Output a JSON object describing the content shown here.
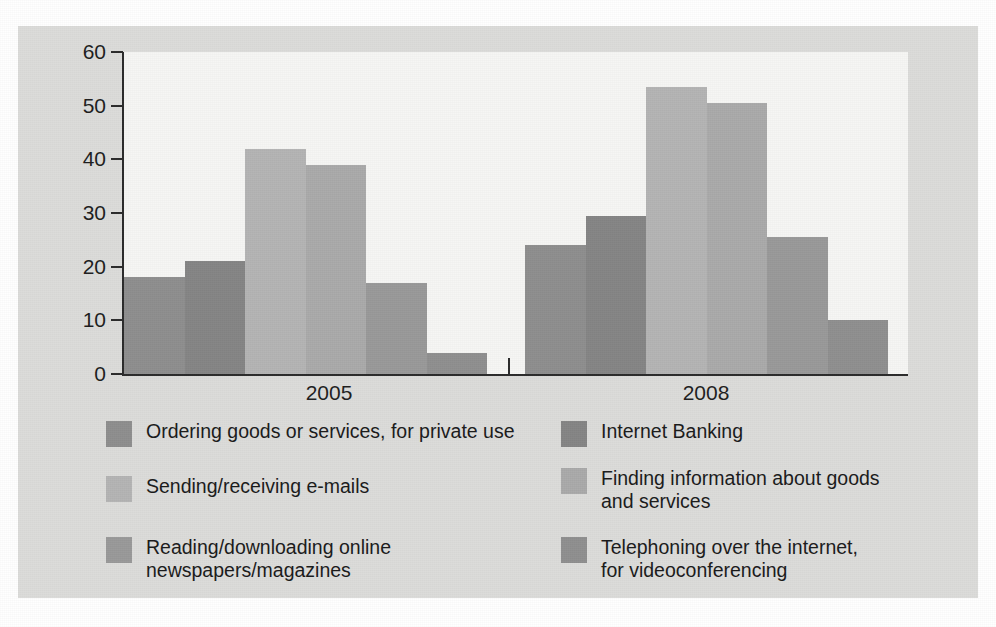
{
  "chart_data": {
    "type": "bar",
    "title": "",
    "subtitle": "",
    "xlabel": "",
    "ylabel": "",
    "categories": [
      "2005",
      "2008"
    ],
    "ylim": [
      0,
      60
    ],
    "yticks": [
      0,
      10,
      20,
      30,
      40,
      50,
      60
    ],
    "ytick_labels": [
      "0",
      "10",
      "20",
      "30",
      "40",
      "50",
      "60"
    ],
    "grid": false,
    "legend_position": "below",
    "grouped": true,
    "bar_gap": false,
    "series": [
      {
        "name": "Ordering goods or services, for private use",
        "color": "#8e8e8e",
        "values": [
          18,
          24
        ]
      },
      {
        "name": "Internet Banking",
        "color": "#858585",
        "values": [
          21,
          29.5
        ]
      },
      {
        "name": "Sending/receiving e-mails",
        "color": "#b4b4b4",
        "values": [
          42,
          53.5
        ]
      },
      {
        "name": "Finding information about goods and services",
        "color": "#aaaaaa",
        "values": [
          39,
          50.5
        ]
      },
      {
        "name": "Reading/downloading online newspapers/magazines",
        "color": "#999999",
        "values": [
          17,
          25.5
        ]
      },
      {
        "name": "Telephoning over the internet, for videoconferencing",
        "color": "#8f8f8f",
        "values": [
          4,
          10
        ]
      }
    ]
  },
  "axis": {
    "y_tick_labels": [
      "60",
      "50",
      "40",
      "30",
      "20",
      "10",
      "0"
    ],
    "x_group_labels": [
      "2005",
      "2008"
    ]
  },
  "legend": {
    "left_column": [
      {
        "label": "Ordering goods or services, for private use",
        "color": "#8e8e8e"
      },
      {
        "label": "Sending/receiving e-mails",
        "color": "#b4b4b4"
      },
      {
        "label": "Reading/downloading online\nnewspapers/magazines",
        "color": "#999999"
      }
    ],
    "right_column": [
      {
        "label": "Internet Banking",
        "color": "#858585"
      },
      {
        "label": "Finding information about goods\nand services",
        "color": "#aaaaaa"
      },
      {
        "label": "Telephoning over the internet,\nfor videoconferencing",
        "color": "#8f8f8f"
      }
    ]
  },
  "colors": {
    "page_background": "#ffffff",
    "panel_background": "#dcdcda",
    "plot_background": "#f6f6f4",
    "axis": "#2b2b2b",
    "text": "#1a1a1a"
  }
}
